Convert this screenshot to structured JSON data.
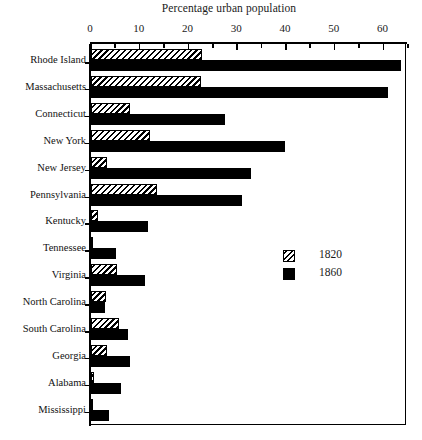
{
  "chart_data": {
    "type": "bar",
    "orientation": "horizontal",
    "title": "Percentage urban population",
    "xlabel": "",
    "ylabel": "",
    "xlim": [
      0,
      65
    ],
    "xticks": [
      0,
      10,
      20,
      30,
      40,
      50,
      60
    ],
    "xtick_labels": [
      "0",
      "10",
      "20",
      "30",
      "40",
      "50",
      "60"
    ],
    "minor_tick_step": 5,
    "grid": false,
    "legend_position": "center-right",
    "categories": [
      "Rhode Island",
      "Massachusetts",
      "Connecticut",
      "New York",
      "New Jersey",
      "Pennsylvania",
      "Kentucky",
      "Tennessee",
      "Virginia",
      "North Carolina",
      "South Carolina",
      "Georgia",
      "Alabama",
      "Mississippi"
    ],
    "series": [
      {
        "name": "1820",
        "fill": "hatched",
        "values": [
          22.7,
          22.5,
          8.0,
          12.0,
          3.2,
          13.5,
          1.5,
          0.5,
          5.3,
          3.0,
          5.8,
          3.2,
          0.6,
          0.4
        ]
      },
      {
        "name": "1860",
        "fill": "solid",
        "values": [
          63.5,
          60.8,
          27.5,
          39.8,
          32.8,
          31.0,
          11.7,
          5.1,
          11.0,
          2.9,
          7.6,
          7.9,
          6.2,
          3.6
        ]
      }
    ]
  },
  "legend": {
    "entries": [
      {
        "label": "1820",
        "swatch": "hatched"
      },
      {
        "label": "1860",
        "swatch": "solid"
      }
    ]
  }
}
